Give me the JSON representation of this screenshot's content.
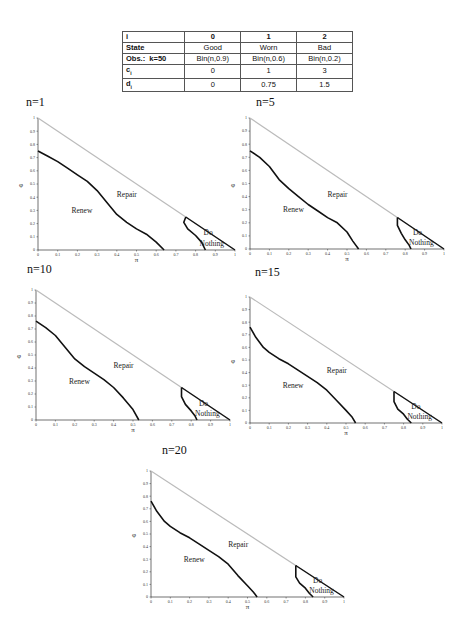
{
  "table": {
    "header": [
      "i",
      "0",
      "1",
      "2"
    ],
    "rows": [
      {
        "label": "State",
        "k": "",
        "values": [
          "Good",
          "Worn",
          "Bad"
        ]
      },
      {
        "label": "Obs.:",
        "k": "k=50",
        "values": [
          "Bin(n,0.9)",
          "Bin(n,0.6)",
          "Bin(n,0.2)"
        ]
      },
      {
        "label": "c",
        "sub": "i",
        "values": [
          "0",
          "1",
          "3"
        ]
      },
      {
        "label": "d",
        "sub": "i",
        "values": [
          "0",
          "0.75",
          "1.5"
        ]
      }
    ]
  },
  "chart_data": [
    {
      "type": "line",
      "title": "n=1",
      "xlabel": "π",
      "ylabel": "φ",
      "xlim": [
        0,
        1
      ],
      "ylim": [
        0,
        1
      ],
      "xticks": [
        "0",
        "0.1",
        "0.2",
        "0.3",
        "0.4",
        "0.5",
        "0.6",
        "0.7",
        "0.8",
        "0.9",
        "1"
      ],
      "yticks": [
        "0",
        "0.1",
        "0.2",
        "0.3",
        "0.4",
        "0.5",
        "0.6",
        "0.7",
        "0.8",
        "0.9",
        "1"
      ],
      "regions": [
        "Renew",
        "Repair",
        "Do Nothing"
      ],
      "series": [
        {
          "name": "simplex boundary (π+φ=1)",
          "x": [
            0,
            1
          ],
          "y": [
            1,
            0
          ],
          "color": "#bbbbbb"
        },
        {
          "name": "Renew/Repair boundary",
          "x": [
            0,
            0.05,
            0.1,
            0.15,
            0.2,
            0.25,
            0.3,
            0.35,
            0.4,
            0.45,
            0.5,
            0.55,
            0.6,
            0.64
          ],
          "y": [
            0.75,
            0.71,
            0.67,
            0.62,
            0.57,
            0.52,
            0.45,
            0.36,
            0.27,
            0.21,
            0.16,
            0.12,
            0.06,
            0
          ],
          "color": "#111111"
        },
        {
          "name": "Repair/Do Nothing boundary",
          "x": [
            0.75,
            0.74,
            0.76,
            0.8,
            0.83,
            0.85
          ],
          "y": [
            0.25,
            0.21,
            0.16,
            0.11,
            0.06,
            0
          ],
          "color": "#111111"
        }
      ]
    },
    {
      "type": "line",
      "title": "n=5",
      "xlabel": "π",
      "ylabel": "φ",
      "xlim": [
        0,
        1
      ],
      "ylim": [
        0,
        1
      ],
      "xticks": [
        "0",
        "0.1",
        "0.2",
        "0.3",
        "0.4",
        "0.5",
        "0.6",
        "0.7",
        "0.8",
        "0.9",
        "1"
      ],
      "yticks": [
        "0",
        "0.1",
        "0.2",
        "0.3",
        "0.4",
        "0.5",
        "0.6",
        "0.7",
        "0.8",
        "0.9",
        "1"
      ],
      "regions": [
        "Renew",
        "Repair",
        "Do Nothing"
      ],
      "series": [
        {
          "name": "simplex boundary (π+φ=1)",
          "x": [
            0,
            1
          ],
          "y": [
            1,
            0
          ],
          "color": "#bbbbbb"
        },
        {
          "name": "Renew/Repair boundary",
          "x": [
            0,
            0.05,
            0.1,
            0.15,
            0.2,
            0.25,
            0.3,
            0.35,
            0.4,
            0.45,
            0.5,
            0.53,
            0.56
          ],
          "y": [
            0.75,
            0.7,
            0.63,
            0.53,
            0.46,
            0.4,
            0.34,
            0.29,
            0.24,
            0.2,
            0.13,
            0.06,
            0
          ],
          "color": "#111111"
        },
        {
          "name": "Repair/Do Nothing boundary",
          "x": [
            0.76,
            0.76,
            0.78,
            0.8,
            0.82,
            0.83
          ],
          "y": [
            0.24,
            0.18,
            0.12,
            0.07,
            0.03,
            0
          ],
          "color": "#111111"
        }
      ]
    },
    {
      "type": "line",
      "title": "n=10",
      "xlabel": "π",
      "ylabel": "φ",
      "xlim": [
        0,
        1
      ],
      "ylim": [
        0,
        1
      ],
      "xticks": [
        "0",
        "0.1",
        "0.2",
        "0.3",
        "0.4",
        "0.5",
        "0.6",
        "0.7",
        "0.8",
        "0.9",
        "1"
      ],
      "yticks": [
        "0",
        "0.1",
        "0.2",
        "0.3",
        "0.4",
        "0.5",
        "0.6",
        "0.7",
        "0.8",
        "0.9",
        "1"
      ],
      "regions": [
        "Renew",
        "Repair",
        "Do Nothing"
      ],
      "series": [
        {
          "name": "simplex boundary (π+φ=1)",
          "x": [
            0,
            1
          ],
          "y": [
            1,
            0
          ],
          "color": "#bbbbbb"
        },
        {
          "name": "Renew/Repair boundary",
          "x": [
            0,
            0.05,
            0.1,
            0.15,
            0.2,
            0.25,
            0.3,
            0.35,
            0.4,
            0.45,
            0.5,
            0.53
          ],
          "y": [
            0.76,
            0.71,
            0.65,
            0.56,
            0.47,
            0.41,
            0.36,
            0.31,
            0.25,
            0.17,
            0.08,
            0
          ],
          "color": "#111111"
        },
        {
          "name": "Repair/Do Nothing boundary",
          "x": [
            0.75,
            0.75,
            0.77,
            0.8,
            0.82,
            0.83
          ],
          "y": [
            0.25,
            0.18,
            0.12,
            0.07,
            0.03,
            0
          ],
          "color": "#111111"
        }
      ]
    },
    {
      "type": "line",
      "title": "n=15",
      "xlabel": "π",
      "ylabel": "φ",
      "xlim": [
        0,
        1
      ],
      "ylim": [
        0,
        1
      ],
      "xticks": [
        "0",
        "0.1",
        "0.2",
        "0.3",
        "0.4",
        "0.5",
        "0.6",
        "0.7",
        "0.8",
        "0.9",
        "1"
      ],
      "yticks": [
        "0",
        "0.1",
        "0.2",
        "0.3",
        "0.4",
        "0.5",
        "0.6",
        "0.7",
        "0.8",
        "0.9",
        "1"
      ],
      "regions": [
        "Renew",
        "Repair",
        "Do Nothing"
      ],
      "series": [
        {
          "name": "simplex boundary (π+φ=1)",
          "x": [
            0,
            1
          ],
          "y": [
            1,
            0
          ],
          "color": "#bbbbbb"
        },
        {
          "name": "Renew/Repair boundary",
          "x": [
            0,
            0.03,
            0.07,
            0.1,
            0.15,
            0.2,
            0.25,
            0.3,
            0.35,
            0.4,
            0.45,
            0.5,
            0.53,
            0.55
          ],
          "y": [
            0.76,
            0.68,
            0.6,
            0.56,
            0.51,
            0.47,
            0.42,
            0.37,
            0.32,
            0.26,
            0.18,
            0.1,
            0.05,
            0
          ],
          "color": "#111111"
        },
        {
          "name": "Repair/Do Nothing boundary",
          "x": [
            0.75,
            0.75,
            0.77,
            0.8,
            0.82,
            0.84
          ],
          "y": [
            0.25,
            0.17,
            0.11,
            0.07,
            0.03,
            0
          ],
          "color": "#111111"
        }
      ]
    },
    {
      "type": "line",
      "title": "n=20",
      "xlabel": "π",
      "ylabel": "φ",
      "xlim": [
        0,
        1
      ],
      "ylim": [
        0,
        1
      ],
      "xticks": [
        "0",
        "0.1",
        "0.2",
        "0.3",
        "0.4",
        "0.5",
        "0.6",
        "0.7",
        "0.8",
        "0.9",
        "1"
      ],
      "yticks": [
        "0",
        "0.1",
        "0.2",
        "0.3",
        "0.4",
        "0.5",
        "0.6",
        "0.7",
        "0.8",
        "0.9",
        "1"
      ],
      "regions": [
        "Renew",
        "Repair",
        "Do Nothing"
      ],
      "series": [
        {
          "name": "simplex boundary (π+φ=1)",
          "x": [
            0,
            1
          ],
          "y": [
            1,
            0
          ],
          "color": "#bbbbbb"
        },
        {
          "name": "Renew/Repair boundary",
          "x": [
            0,
            0.03,
            0.07,
            0.1,
            0.15,
            0.2,
            0.25,
            0.3,
            0.35,
            0.4,
            0.45,
            0.5,
            0.53,
            0.55
          ],
          "y": [
            0.76,
            0.68,
            0.6,
            0.56,
            0.51,
            0.47,
            0.42,
            0.37,
            0.32,
            0.26,
            0.17,
            0.09,
            0.04,
            0
          ],
          "color": "#111111"
        },
        {
          "name": "Repair/Do Nothing boundary",
          "x": [
            0.75,
            0.75,
            0.77,
            0.8,
            0.82,
            0.84
          ],
          "y": [
            0.25,
            0.16,
            0.11,
            0.07,
            0.03,
            0
          ],
          "color": "#111111"
        }
      ]
    }
  ]
}
